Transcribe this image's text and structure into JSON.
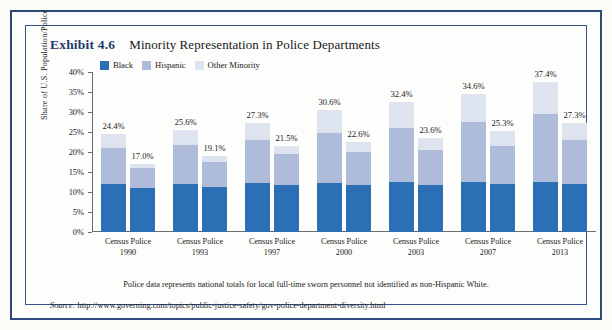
{
  "exhibit": {
    "number": "Exhibit 4.6",
    "title": "Minority Representation in Police Departments"
  },
  "note": "Police data represents national totals for local full-time sworn personnel not identified as non-Hispanic White.",
  "source": {
    "label": "Source:",
    "url": "http://www.governing.com/topics/public-justice-safety/gov-police-department-diversity.html"
  },
  "colors": {
    "black": "#2C6FB5",
    "hispanic": "#AEBCD9",
    "other": "#DEE4EF",
    "frame": "#2e4a7d",
    "title": "#22396b"
  },
  "chart_data": {
    "type": "bar",
    "subtype": "stacked-grouped",
    "title": "Minority Representation in Police Departments",
    "xlabel": "",
    "ylabel": "Share of U.S. Population/Police",
    "ylim": [
      0,
      40
    ],
    "ytick_labels": [
      "40%",
      "35%",
      "30%",
      "25%",
      "20%",
      "15%",
      "10%",
      "5%",
      "0%"
    ],
    "ytick_values": [
      40,
      35,
      30,
      25,
      20,
      15,
      10,
      5,
      0
    ],
    "grid": false,
    "legend_position": "top-left",
    "legend": [
      "Black",
      "Hispanic",
      "Other Minority"
    ],
    "series": [
      {
        "name": "Black",
        "color": "#2C6FB5"
      },
      {
        "name": "Hispanic",
        "color": "#AEBCD9"
      },
      {
        "name": "Other Minority",
        "color": "#DEE4EF"
      }
    ],
    "groups": [
      {
        "year": "1990",
        "bars": [
          {
            "category": "Census",
            "total": 24.4,
            "total_label": "24.4%",
            "black": 12.0,
            "hispanic": 9.0,
            "other": 3.4
          },
          {
            "category": "Police",
            "total": 17.0,
            "total_label": "17.0%",
            "black": 11.0,
            "hispanic": 5.0,
            "other": 1.0
          }
        ]
      },
      {
        "year": "1993",
        "bars": [
          {
            "category": "Census",
            "total": 25.6,
            "total_label": "25.6%",
            "black": 12.1,
            "hispanic": 9.6,
            "other": 3.9
          },
          {
            "category": "Police",
            "total": 19.1,
            "total_label": "19.1%",
            "black": 11.3,
            "hispanic": 6.2,
            "other": 1.6
          }
        ]
      },
      {
        "year": "1997",
        "bars": [
          {
            "category": "Census",
            "total": 27.3,
            "total_label": "27.3%",
            "black": 12.2,
            "hispanic": 10.7,
            "other": 4.4
          },
          {
            "category": "Police",
            "total": 21.5,
            "total_label": "21.5%",
            "black": 11.7,
            "hispanic": 7.8,
            "other": 2.0
          }
        ]
      },
      {
        "year": "2000",
        "bars": [
          {
            "category": "Census",
            "total": 30.6,
            "total_label": "30.6%",
            "black": 12.3,
            "hispanic": 12.5,
            "other": 5.8
          },
          {
            "category": "Police",
            "total": 22.6,
            "total_label": "22.6%",
            "black": 11.7,
            "hispanic": 8.3,
            "other": 2.6
          }
        ]
      },
      {
        "year": "2003",
        "bars": [
          {
            "category": "Census",
            "total": 32.4,
            "total_label": "32.4%",
            "black": 12.4,
            "hispanic": 13.7,
            "other": 6.3
          },
          {
            "category": "Police",
            "total": 23.6,
            "total_label": "23.6%",
            "black": 11.7,
            "hispanic": 8.8,
            "other": 3.1
          }
        ]
      },
      {
        "year": "2007",
        "bars": [
          {
            "category": "Census",
            "total": 34.6,
            "total_label": "34.6%",
            "black": 12.4,
            "hispanic": 15.1,
            "other": 7.1
          },
          {
            "category": "Police",
            "total": 25.3,
            "total_label": "25.3%",
            "black": 11.9,
            "hispanic": 9.6,
            "other": 3.8
          }
        ]
      },
      {
        "year": "2013",
        "bars": [
          {
            "category": "Census",
            "total": 37.4,
            "total_label": "37.4%",
            "black": 12.5,
            "hispanic": 16.9,
            "other": 8.0
          },
          {
            "category": "Police",
            "total": 27.3,
            "total_label": "27.3%",
            "black": 12.0,
            "hispanic": 11.0,
            "other": 4.3
          }
        ]
      }
    ]
  }
}
